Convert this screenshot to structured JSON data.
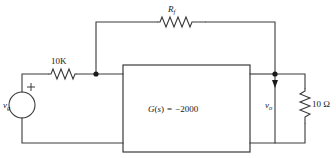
{
  "figure": {
    "name": "operational-amplifier-feedback-circuit",
    "background_color": "#ffffff",
    "line_color": "#3a3a3a",
    "text_color": "#1a1a1a"
  },
  "source": {
    "label_main": "v",
    "label_sub": "g",
    "polarity_plus": "+",
    "type": "voltage-source-circle"
  },
  "input_resistor": {
    "label": "10K"
  },
  "feedback_resistor": {
    "label_main": "R",
    "label_sub": "f"
  },
  "block": {
    "label": "G(s) = −2000",
    "label_g": "G",
    "label_open_paren": "(",
    "label_s": "s",
    "label_close_paren": ")",
    "label_equals": "=",
    "label_value": "−2000"
  },
  "output": {
    "label_main": "v",
    "label_sub": "o",
    "arrow_direction": "down"
  },
  "load_resistor": {
    "label": "10 Ω"
  }
}
